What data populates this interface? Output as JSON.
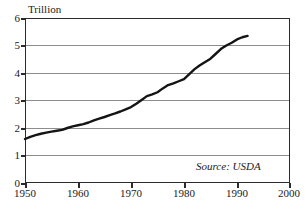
{
  "chart_data": {
    "type": "line",
    "title": "",
    "subtitle": "",
    "ylabel": "Trillion",
    "xlabel": "",
    "annotation": "Source: USDA",
    "grid": true,
    "legend": "none",
    "xlim": [
      1950,
      2000
    ],
    "ylim": [
      0,
      6
    ],
    "xticks": [
      "1950",
      "1960",
      "1970",
      "1980",
      "1990",
      "2000"
    ],
    "yticks": [
      "0",
      "1",
      "2",
      "3",
      "4",
      "5",
      "6"
    ],
    "series": [
      {
        "name": "Value",
        "x": [
          1950,
          1951,
          1952,
          1953,
          1954,
          1955,
          1956,
          1957,
          1958,
          1959,
          1960,
          1961,
          1962,
          1963,
          1964,
          1965,
          1966,
          1967,
          1968,
          1969,
          1970,
          1971,
          1972,
          1973,
          1974,
          1975,
          1976,
          1977,
          1978,
          1979,
          1980,
          1981,
          1982,
          1983,
          1984,
          1985,
          1986,
          1987,
          1988,
          1989,
          1990,
          1991,
          1992
        ],
        "values": [
          1.6,
          1.68,
          1.74,
          1.79,
          1.83,
          1.87,
          1.9,
          1.93,
          2.0,
          2.06,
          2.1,
          2.14,
          2.2,
          2.28,
          2.34,
          2.4,
          2.47,
          2.53,
          2.6,
          2.68,
          2.76,
          2.88,
          3.02,
          3.16,
          3.22,
          3.3,
          3.44,
          3.56,
          3.62,
          3.7,
          3.78,
          3.96,
          4.14,
          4.28,
          4.4,
          4.52,
          4.7,
          4.88,
          5.0,
          5.1,
          5.22,
          5.3,
          5.35
        ]
      }
    ]
  },
  "axis": {
    "ytitle": "Trillion",
    "ytick_labels": [
      "6",
      "5",
      "4",
      "3",
      "2",
      "1",
      "0"
    ],
    "xtick_labels": [
      "1950",
      "1960",
      "1970",
      "1980",
      "1990",
      "2000"
    ]
  },
  "note": {
    "source": "Source: USDA"
  }
}
